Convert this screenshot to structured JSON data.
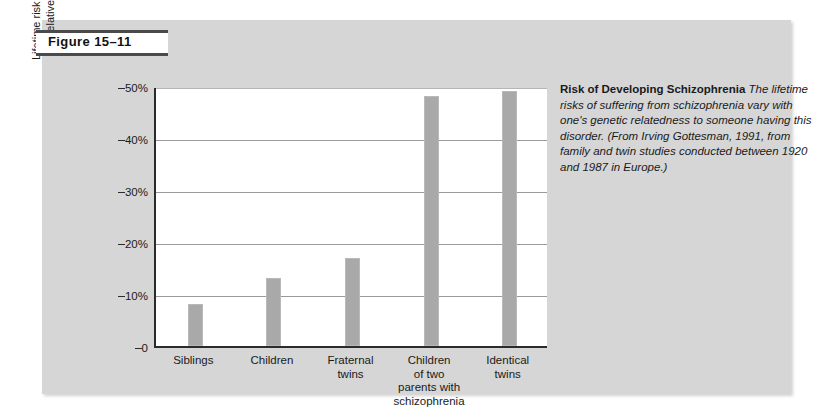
{
  "figure": {
    "label": "Figure 15–11"
  },
  "caption": {
    "lead": "Risk of Developing Schizophrenia",
    "body": "The lifetime risks of suffering from schizophrenia vary with one's genetic relatedness to someone having this disorder. (From Irving Gottesman, 1991, from family and twin studies conducted between 1920 and 1987 in Europe.)"
  },
  "axis": {
    "y_title_line1": "Lifetime risk of developing schizophrenia",
    "y_title_line2": "for relatives of a schizophrenia victim",
    "y_ticks": [
      "50%",
      "40%",
      "30%",
      "20%",
      "10%",
      "0"
    ]
  },
  "colors": {
    "panel": "#d6d6d6",
    "bar": "#a9a9a9",
    "axis": "#2b2b2b",
    "gridline": "#9a9a9a",
    "plot_background": "#ffffff"
  },
  "chart_data": {
    "type": "bar",
    "title": "Risk of Developing Schizophrenia",
    "xlabel": "",
    "ylabel": "Lifetime risk of developing schizophrenia for relatives of a schizophrenia victim",
    "categories": [
      "Siblings",
      "Children",
      "Fraternal twins",
      "Children of two parents with schizophrenia",
      "Identical twins"
    ],
    "category_display": [
      "Siblings",
      "Children",
      "Fraternal\ntwins",
      "Children\nof two\nparents with\nschizophrenia",
      "Identical\ntwins"
    ],
    "values": [
      8,
      13,
      17,
      48,
      49
    ],
    "value_unit": "%",
    "ylim": [
      0,
      50
    ],
    "ytick_values": [
      50,
      40,
      30,
      20,
      10,
      0
    ],
    "grid": true,
    "legend": "none"
  }
}
